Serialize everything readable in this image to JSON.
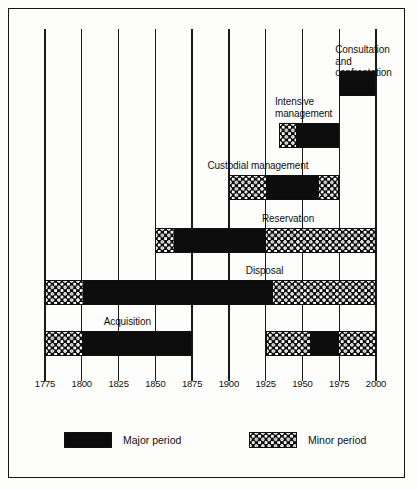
{
  "chart_data": {
    "type": "bar",
    "chart_subtype": "horizontal-timeline-gantt",
    "title": "",
    "xlabel": "",
    "ylabel": "",
    "xlim": [
      1775,
      2000
    ],
    "x_ticks": [
      1775,
      1800,
      1825,
      1850,
      1875,
      1900,
      1925,
      1950,
      1975,
      2000
    ],
    "x_tick_labels": [
      "1775",
      "1800",
      "1825",
      "1850",
      "1875",
      "1900",
      "1925",
      "1950",
      "1975",
      "2000"
    ],
    "grid": true,
    "grid_axis": "x",
    "legend_position": "bottom",
    "legend": [
      {
        "key": "major",
        "label": "Major period",
        "fill": "solid-black",
        "color": "#0d0d0d"
      },
      {
        "key": "minor",
        "label": "Minor period",
        "fill": "hatched-dotted",
        "color": "#0d0d0d"
      }
    ],
    "rows": [
      {
        "label": "Consultation and\nconfrontation",
        "label_lines": [
          "Consultation and",
          "confrontation"
        ],
        "label_position": "above-left",
        "segments": [
          {
            "type": "major",
            "start": 1975,
            "end": 2000
          }
        ]
      },
      {
        "label": "Intensive\nmanagement",
        "label_lines": [
          "Intensive",
          "management"
        ],
        "label_position": "above-left",
        "segments": [
          {
            "type": "minor",
            "start": 1934,
            "end": 1945
          },
          {
            "type": "major",
            "start": 1945,
            "end": 1975
          }
        ]
      },
      {
        "label": "Custodial management",
        "label_lines": [
          "Custodial management"
        ],
        "label_position": "above-center",
        "segments": [
          {
            "type": "minor",
            "start": 1900,
            "end": 1925
          },
          {
            "type": "major",
            "start": 1925,
            "end": 1962
          },
          {
            "type": "minor",
            "start": 1962,
            "end": 1975
          }
        ]
      },
      {
        "label": "Reservation",
        "label_lines": [
          "Reservation"
        ],
        "label_position": "above-center",
        "segments": [
          {
            "type": "minor",
            "start": 1850,
            "end": 1862
          },
          {
            "type": "major",
            "start": 1862,
            "end": 1925
          },
          {
            "type": "minor",
            "start": 1925,
            "end": 2000
          }
        ]
      },
      {
        "label": "Disposal",
        "label_lines": [
          "Disposal"
        ],
        "label_position": "above-center",
        "segments": [
          {
            "type": "minor",
            "start": 1775,
            "end": 1800
          },
          {
            "type": "major",
            "start": 1800,
            "end": 1930
          },
          {
            "type": "minor",
            "start": 1930,
            "end": 2000
          }
        ]
      },
      {
        "label": "Acquisition",
        "label_lines": [
          "Acquisition"
        ],
        "label_position": "above-center",
        "segments": [
          {
            "type": "minor",
            "start": 1775,
            "end": 1800
          },
          {
            "type": "major",
            "start": 1800,
            "end": 1875
          }
        ]
      },
      {
        "label": "",
        "label_lines": [],
        "label_position": "none",
        "segments": [
          {
            "type": "minor",
            "start": 1925,
            "end": 1955
          },
          {
            "type": "major",
            "start": 1955,
            "end": 1975
          },
          {
            "type": "minor",
            "start": 1975,
            "end": 2000
          }
        ]
      }
    ]
  }
}
